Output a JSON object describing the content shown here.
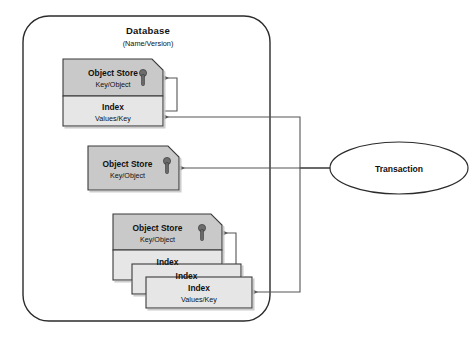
{
  "diagram": {
    "type": "entity-relationship-diagram",
    "database": {
      "label": "Database",
      "sublabel": "(Name/Version)"
    },
    "transaction": {
      "label": "Transaction"
    },
    "stores": [
      {
        "id": "store-1",
        "store_label": "Object Store",
        "store_sublabel": "Key/Object",
        "key_icon": "key-icon",
        "indexes": [
          {
            "label": "Index",
            "sublabel": "Values/Key"
          }
        ]
      },
      {
        "id": "store-2",
        "store_label": "Object Store",
        "store_sublabel": "Key/Object",
        "key_icon": "key-icon",
        "indexes": []
      },
      {
        "id": "store-3",
        "store_label": "Object Store",
        "store_sublabel": "Key/Object",
        "key_icon": "key-icon",
        "indexes": [
          {
            "label": "Index",
            "sublabel": ""
          },
          {
            "label": "Index",
            "sublabel": ""
          },
          {
            "label": "Index",
            "sublabel": "Values/Key"
          }
        ]
      }
    ],
    "colors": {
      "object_store_fill": "#c9c9c9",
      "index_fill": "#e6e6e6",
      "stroke": "#3a3a3a",
      "connector": "#555555",
      "boundary": "#2b2b2b",
      "text": "#111111",
      "page_background": "#ffffff"
    },
    "connectors": [
      {
        "from": "transaction",
        "to": "store-1-index",
        "style": "arrow"
      },
      {
        "from": "transaction",
        "to": "store-2",
        "style": "arrow"
      },
      {
        "from": "transaction",
        "to": "store-3-index-3",
        "style": "arrow"
      },
      {
        "from": "store-1-index",
        "to": "store-1-objectstore",
        "style": "arrow-loop"
      },
      {
        "from": "store-3-index-3",
        "to": "store-3-objectstore",
        "style": "arrow-loop"
      }
    ]
  }
}
